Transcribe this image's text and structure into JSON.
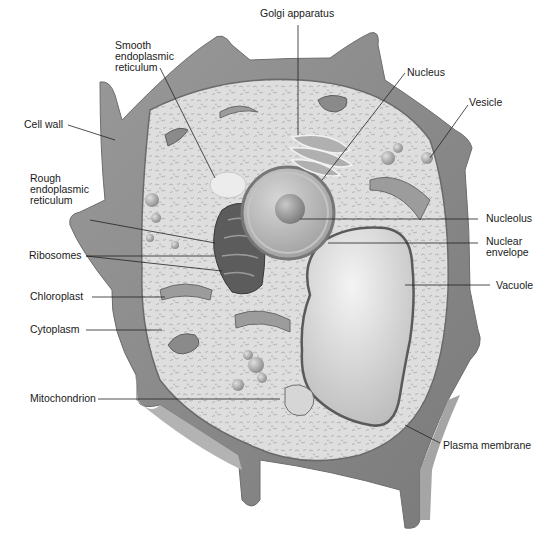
{
  "diagram": {
    "colors": {
      "background": "#ffffff",
      "cell_wall": "#8c8c8c",
      "cell_wall_light": "#a8a8a8",
      "cell_wall_dark": "#6e6e6e",
      "cytoplasm": "#dedede",
      "cytoplasm_speckle": "#a6a6a6",
      "organelle": "#9a9a9a",
      "nucleus": "#bdbdbd",
      "vacuole": "#cfcfcf",
      "leader_line": "#222222",
      "label_text": "#1a1a1a"
    },
    "labels": [
      {
        "id": "smooth-er",
        "text": "Smooth\nendoplasmic\nreticulum"
      },
      {
        "id": "golgi",
        "text": "Golgi apparatus"
      },
      {
        "id": "nucleus",
        "text": "Nucleus"
      },
      {
        "id": "vesicle",
        "text": "Vesicle"
      },
      {
        "id": "cell-wall",
        "text": "Cell wall"
      },
      {
        "id": "rough-er",
        "text": "Rough\nendoplasmic\nreticulum"
      },
      {
        "id": "nucleolus",
        "text": "Nucleolus"
      },
      {
        "id": "nuclear-envelope",
        "text": "Nuclear\nenvelope"
      },
      {
        "id": "ribosomes",
        "text": "Ribosomes"
      },
      {
        "id": "vacuole",
        "text": "Vacuole"
      },
      {
        "id": "chloroplast",
        "text": "Chloroplast"
      },
      {
        "id": "cytoplasm",
        "text": "Cytoplasm"
      },
      {
        "id": "mitochondrion",
        "text": "Mitochondrion"
      },
      {
        "id": "plasma-membrane",
        "text": "Plasma membrane"
      }
    ]
  }
}
